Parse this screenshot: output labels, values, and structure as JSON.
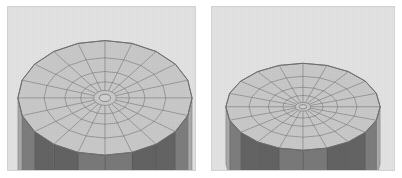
{
  "scene": {
    "title": "Faceted cylinder mesh comparison",
    "background_color": "#ffffff",
    "viewport_background_color": "#e3e3e3",
    "viewport_border_color": "#d2d2d2",
    "panel_count": 2
  },
  "palette": {
    "top_face_fill": "#c9c9c9",
    "top_face_fill_light": "#d0d0d0",
    "wireframe_stroke": "#6f6f6f",
    "rim_stroke": "#5f5f5f",
    "side_wall_light": "#c4c4c4",
    "side_wall_mid": "#8f8f8f",
    "side_wall_dark": "#4a4a4a",
    "side_wall_darkest": "#1c1c1c",
    "background": "#e3e3e3"
  },
  "panels": [
    {
      "id": "left",
      "name": "low-elevation-view",
      "label": "",
      "mesh": {
        "shape": "cylinder",
        "radial_segments": 20,
        "concentric_rings": 5,
        "ring_radii_fraction": [
          0.13,
          0.28,
          0.46,
          0.7,
          1.0
        ],
        "top_face_visible": true,
        "side_wall_visible": true
      },
      "camera": {
        "elevation_deg": 22,
        "azimuth_deg": 0,
        "projection": "perspective"
      },
      "geometry": {
        "center_x": 98,
        "center_y": 92,
        "radius_x": 88,
        "radius_y": 58,
        "wall_height": 78
      }
    },
    {
      "id": "right",
      "name": "high-elevation-view",
      "label": "",
      "mesh": {
        "shape": "cylinder",
        "radial_segments": 20,
        "concentric_rings": 5,
        "ring_radii_fraction": [
          0.1,
          0.26,
          0.45,
          0.7,
          1.0
        ],
        "top_face_visible": true,
        "side_wall_visible": true
      },
      "camera": {
        "elevation_deg": 15,
        "azimuth_deg": 0,
        "projection": "perspective"
      },
      "geometry": {
        "center_x": 92,
        "center_y": 101,
        "radius_x": 78,
        "radius_y": 44,
        "wall_height": 58
      }
    }
  ]
}
